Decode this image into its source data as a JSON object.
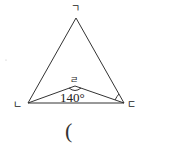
{
  "diagram": {
    "type": "geometry-triangle",
    "vertices": {
      "apex": {
        "label": "ㄱ",
        "x": 76,
        "y": 18
      },
      "left": {
        "label": "ㄴ",
        "x": 28,
        "y": 103
      },
      "right": {
        "label": "ㄷ",
        "x": 124,
        "y": 103
      },
      "inner": {
        "label": "ㄹ",
        "x": 75,
        "y": 86
      }
    },
    "angle_label": "140°",
    "line_color": "#333333"
  },
  "answer": {
    "open_paren": "("
  }
}
